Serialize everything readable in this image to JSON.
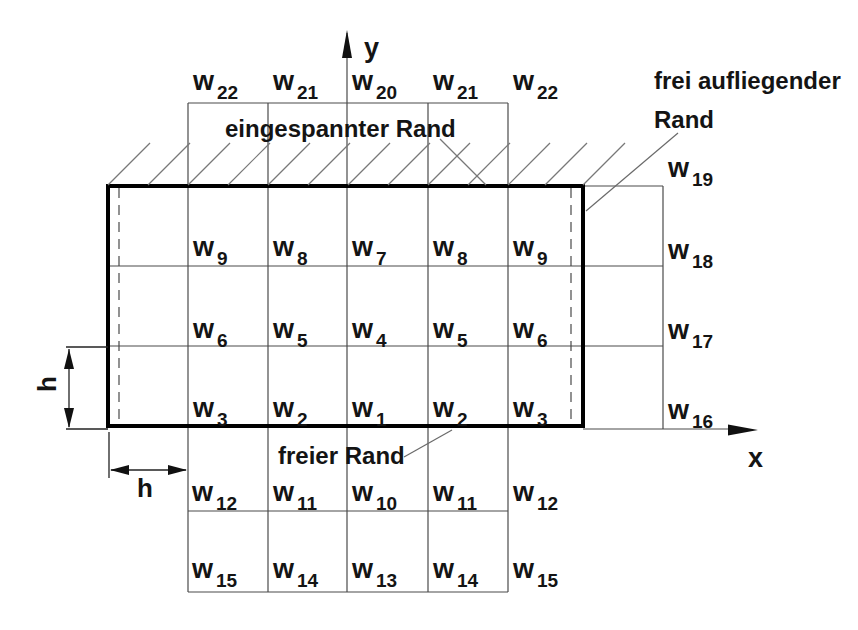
{
  "colors": {
    "background": "#ffffff",
    "thin_line": "#4a4a4a",
    "plate_border": "#000000",
    "text": "#141414"
  },
  "axes": {
    "x_label": "x",
    "y_label": "y"
  },
  "edge_labels": {
    "clamped": "eingespannter Rand",
    "free": "freier Rand",
    "simply_supported_line1": "frei aufliegender",
    "simply_supported_line2": "Rand"
  },
  "dimension_labels": {
    "vertical_spacing": "h",
    "horizontal_spacing": "h"
  },
  "node_labels": {
    "row_above_top": [
      {
        "base": "w",
        "sub": "22"
      },
      {
        "base": "w",
        "sub": "21"
      },
      {
        "base": "w",
        "sub": "20"
      },
      {
        "base": "w",
        "sub": "21"
      },
      {
        "base": "w",
        "sub": "22"
      }
    ],
    "row_upper": [
      {
        "base": "w",
        "sub": "9"
      },
      {
        "base": "w",
        "sub": "8"
      },
      {
        "base": "w",
        "sub": "7"
      },
      {
        "base": "w",
        "sub": "8"
      },
      {
        "base": "w",
        "sub": "9"
      }
    ],
    "row_middle": [
      {
        "base": "w",
        "sub": "6"
      },
      {
        "base": "w",
        "sub": "5"
      },
      {
        "base": "w",
        "sub": "4"
      },
      {
        "base": "w",
        "sub": "5"
      },
      {
        "base": "w",
        "sub": "6"
      }
    ],
    "row_lower": [
      {
        "base": "w",
        "sub": "3"
      },
      {
        "base": "w",
        "sub": "2"
      },
      {
        "base": "w",
        "sub": "1"
      },
      {
        "base": "w",
        "sub": "2"
      },
      {
        "base": "w",
        "sub": "3"
      }
    ],
    "row_below_first": [
      {
        "base": "w",
        "sub": "12"
      },
      {
        "base": "w",
        "sub": "11"
      },
      {
        "base": "w",
        "sub": "10"
      },
      {
        "base": "w",
        "sub": "11"
      },
      {
        "base": "w",
        "sub": "12"
      }
    ],
    "row_below_second": [
      {
        "base": "w",
        "sub": "15"
      },
      {
        "base": "w",
        "sub": "14"
      },
      {
        "base": "w",
        "sub": "13"
      },
      {
        "base": "w",
        "sub": "14"
      },
      {
        "base": "w",
        "sub": "15"
      }
    ],
    "column_right": [
      {
        "base": "w",
        "sub": "19"
      },
      {
        "base": "w",
        "sub": "18"
      },
      {
        "base": "w",
        "sub": "17"
      },
      {
        "base": "w",
        "sub": "16"
      }
    ]
  }
}
